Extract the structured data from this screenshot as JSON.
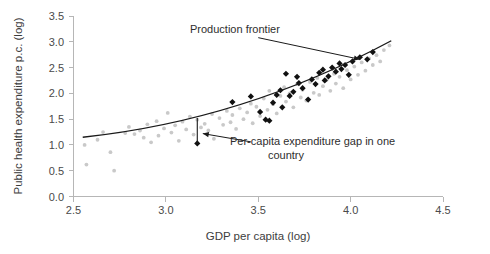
{
  "chart_data": {
    "type": "scatter",
    "title": "",
    "xlabel": "GDP per capita (log)",
    "ylabel": "Public health expenditure p.c. (log)",
    "xlim": [
      2.5,
      4.5
    ],
    "ylim": [
      0.0,
      3.5
    ],
    "xticks": [
      "2.5",
      "3.0",
      "3.5",
      "4.0",
      "4.5"
    ],
    "yticks": [
      "0.0",
      "0.5",
      "1.0",
      "1.5",
      "2.0",
      "2.5",
      "3.0",
      "3.5"
    ],
    "xtick_values": [
      2.5,
      3.0,
      3.5,
      4.0,
      4.5
    ],
    "ytick_values": [
      0.0,
      0.5,
      1.0,
      1.5,
      2.0,
      2.5,
      3.0,
      3.5
    ],
    "grid": false,
    "legend": "none",
    "colors": {
      "gray_points": "#c9c9c9",
      "black_points": "#111111",
      "frontier": "#1a1a1a",
      "axis": "#b6b6b6",
      "text": "#3d3d3d",
      "background": "#ffffff"
    },
    "series": [
      {
        "name": "Observed country observations",
        "marker": "circle",
        "color": "#c9c9c9",
        "points": [
          [
            2.56,
            1.0
          ],
          [
            2.57,
            0.62
          ],
          [
            2.63,
            1.1
          ],
          [
            2.66,
            1.25
          ],
          [
            2.7,
            0.86
          ],
          [
            2.72,
            0.5
          ],
          [
            2.78,
            1.23
          ],
          [
            2.8,
            1.35
          ],
          [
            2.83,
            1.21
          ],
          [
            2.86,
            1.28
          ],
          [
            2.88,
            1.14
          ],
          [
            2.9,
            1.4
          ],
          [
            2.92,
            1.05
          ],
          [
            2.95,
            1.46
          ],
          [
            2.96,
            1.18
          ],
          [
            2.99,
            1.32
          ],
          [
            3.01,
            1.62
          ],
          [
            3.03,
            1.24
          ],
          [
            3.05,
            1.38
          ],
          [
            3.07,
            1.08
          ],
          [
            3.09,
            1.45
          ],
          [
            3.11,
            1.3
          ],
          [
            3.13,
            1.55
          ],
          [
            3.15,
            1.2
          ],
          [
            3.17,
            1.49
          ],
          [
            3.19,
            1.34
          ],
          [
            3.21,
            1.41
          ],
          [
            3.23,
            1.28
          ],
          [
            3.25,
            1.6
          ],
          [
            3.26,
            1.12
          ],
          [
            3.29,
            1.52
          ],
          [
            3.31,
            1.39
          ],
          [
            3.33,
            1.66
          ],
          [
            3.35,
            1.44
          ],
          [
            3.36,
            1.58
          ],
          [
            3.38,
            1.31
          ],
          [
            3.4,
            1.71
          ],
          [
            3.42,
            1.5
          ],
          [
            3.44,
            1.63
          ],
          [
            3.46,
            1.8
          ],
          [
            3.47,
            1.42
          ],
          [
            3.49,
            1.74
          ],
          [
            3.51,
            1.56
          ],
          [
            3.53,
            1.9
          ],
          [
            3.55,
            1.68
          ],
          [
            3.56,
            2.05
          ],
          [
            3.58,
            1.79
          ],
          [
            3.6,
            1.61
          ],
          [
            3.62,
            1.95
          ],
          [
            3.64,
            2.12
          ],
          [
            3.65,
            1.84
          ],
          [
            3.67,
            2.0
          ],
          [
            3.69,
            1.73
          ],
          [
            3.71,
            2.18
          ],
          [
            3.73,
            1.92
          ],
          [
            3.74,
            2.07
          ],
          [
            3.76,
            1.86
          ],
          [
            3.78,
            2.22
          ],
          [
            3.8,
            2.01
          ],
          [
            3.82,
            2.3
          ],
          [
            3.83,
            1.97
          ],
          [
            3.85,
            2.14
          ],
          [
            3.87,
            2.26
          ],
          [
            3.89,
            2.05
          ],
          [
            3.91,
            2.38
          ],
          [
            3.92,
            2.19
          ],
          [
            3.94,
            2.32
          ],
          [
            3.96,
            2.1
          ],
          [
            3.98,
            2.45
          ],
          [
            4.0,
            2.27
          ],
          [
            4.02,
            2.52
          ],
          [
            4.04,
            2.36
          ],
          [
            4.06,
            2.6
          ],
          [
            4.08,
            2.44
          ],
          [
            4.1,
            2.68
          ],
          [
            4.12,
            2.55
          ],
          [
            4.14,
            2.74
          ],
          [
            4.16,
            2.62
          ],
          [
            4.18,
            2.84
          ],
          [
            4.21,
            2.93
          ]
        ]
      },
      {
        "name": "Frontier countries",
        "marker": "diamond",
        "color": "#111111",
        "points": [
          [
            3.17,
            1.03
          ],
          [
            3.36,
            1.83
          ],
          [
            3.46,
            1.94
          ],
          [
            3.51,
            1.64
          ],
          [
            3.54,
            1.49
          ],
          [
            3.56,
            1.47
          ],
          [
            3.58,
            1.82
          ],
          [
            3.6,
            1.97
          ],
          [
            3.62,
            2.06
          ],
          [
            3.63,
            1.73
          ],
          [
            3.65,
            2.38
          ],
          [
            3.67,
            1.95
          ],
          [
            3.69,
            2.03
          ],
          [
            3.71,
            2.32
          ],
          [
            3.72,
            2.2
          ],
          [
            3.74,
            2.1
          ],
          [
            3.77,
            1.88
          ],
          [
            3.79,
            2.27
          ],
          [
            3.81,
            2.18
          ],
          [
            3.83,
            2.4
          ],
          [
            3.85,
            2.46
          ],
          [
            3.86,
            2.25
          ],
          [
            3.88,
            2.33
          ],
          [
            3.9,
            2.5
          ],
          [
            3.92,
            2.42
          ],
          [
            3.94,
            2.58
          ],
          [
            3.95,
            2.47
          ],
          [
            3.97,
            2.55
          ],
          [
            3.99,
            2.36
          ],
          [
            4.01,
            2.62
          ],
          [
            4.05,
            2.7
          ],
          [
            4.09,
            2.66
          ],
          [
            4.12,
            2.8
          ]
        ]
      }
    ],
    "trendline": {
      "name": "Production frontier",
      "type": "curve",
      "from": [
        2.55,
        1.15
      ],
      "to": [
        4.22,
        3.02
      ],
      "control": [
        3.4,
        1.78
      ]
    },
    "annotations": [
      {
        "id": "production-frontier",
        "text": "Production frontier",
        "text_x": 3.12,
        "text_y": 3.18,
        "arrow_from": [
          3.5,
          3.08
        ],
        "arrow_to": [
          4.05,
          2.66
        ]
      },
      {
        "id": "expenditure-gap",
        "text": "Per-capita expenditure gap in one country",
        "text_line1": "Per-capita expenditure gap in one",
        "text_line2": "country",
        "text_x": 3.5,
        "text_y": 1.02,
        "arrow_from": [
          3.46,
          1.06
        ],
        "arrow_to": [
          3.2,
          1.22
        ]
      }
    ],
    "gap_marker": {
      "x": 3.17,
      "y_top": 1.52,
      "y_bottom": 1.03,
      "label": "expenditure gap segment"
    }
  }
}
